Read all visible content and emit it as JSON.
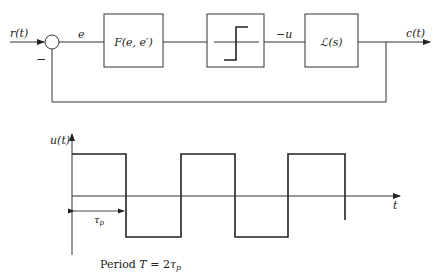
{
  "block_diagram": {
    "input_label": "r(t)",
    "summing_sign": "−",
    "error_label": "e",
    "controller_block": "F(e, e′)",
    "relay_block": "relay-icon",
    "relay_output_label": "−u",
    "plant_block": "ℒ(s)",
    "output_label": "c(t)"
  },
  "waveform": {
    "y_axis_label": "u(t)",
    "x_axis_label": "t",
    "pulse_width_label": "τp",
    "period_caption_prefix": "Period ",
    "period_caption_T": "T",
    "period_caption_eq": " = 2",
    "period_caption_tau": "τ",
    "period_caption_sub": "p"
  }
}
